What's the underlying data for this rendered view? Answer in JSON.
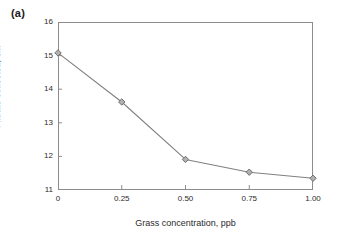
{
  "figure": {
    "panel_label": "(a)",
    "line_color": "#808080",
    "marker_fill": "#b0b0b0",
    "marker_edge": "#707070",
    "axis_color": "#8c8c8c",
    "text_color": "#2b2b2b"
  },
  "chart_data": {
    "type": "line",
    "title": "",
    "subtitle": "",
    "xlabel": "Grass concentration, ppb",
    "ylabel_text": "Filtrate collected, cm",
    "ylabel_superscript": "3",
    "ylabel": "Filtrate collected, cm3",
    "x": [
      0,
      0.25,
      0.5,
      0.75,
      1.0
    ],
    "values": [
      15.08,
      13.62,
      11.91,
      11.53,
      11.35
    ],
    "series": [
      {
        "name": "Filtrate collected",
        "values": [
          15.08,
          13.62,
          11.91,
          11.53,
          11.35
        ]
      }
    ],
    "xlim": [
      0,
      1.0
    ],
    "ylim": [
      11,
      16
    ],
    "xticks": [
      0,
      0.25,
      0.5,
      0.75,
      1.0
    ],
    "xtick_labels": [
      "0",
      "0.25",
      "0.50",
      "0.75",
      "1.00"
    ],
    "yticks": [
      11,
      12,
      13,
      14,
      15,
      16
    ],
    "ytick_labels": [
      "11",
      "12",
      "13",
      "14",
      "15",
      "16"
    ],
    "grid": false,
    "legend": false,
    "legend_position": "none",
    "marker": "diamond",
    "annotations": [
      "(a)"
    ]
  }
}
